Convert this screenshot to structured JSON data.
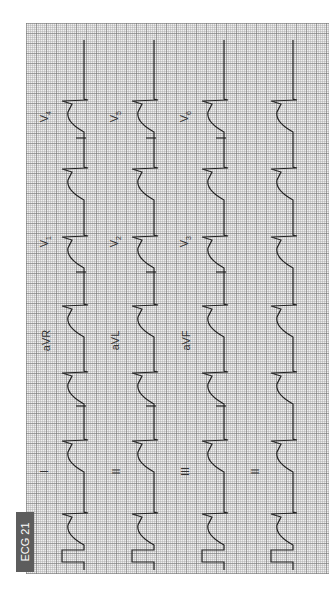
{
  "figure": {
    "tag": "ECG 21",
    "tag_bg_color": "#5d5d5d",
    "orientation": "rotated 90deg counter-clockwise",
    "grid": {
      "small_box_px": 2,
      "large_box_px": 10,
      "bg_color": "#efefef"
    }
  },
  "leads": {
    "col1": [
      {
        "name": "I",
        "label": "I"
      },
      {
        "name": "aVR",
        "label": "aVR"
      },
      {
        "name": "V1",
        "label": "V",
        "sub": "1"
      },
      {
        "name": "V4",
        "label": "V",
        "sub": "4"
      }
    ],
    "col2": [
      {
        "name": "II",
        "label": "II"
      },
      {
        "name": "aVL",
        "label": "aVL"
      },
      {
        "name": "V2",
        "label": "V",
        "sub": "2"
      },
      {
        "name": "V5",
        "label": "V",
        "sub": "5"
      }
    ],
    "col3": [
      {
        "name": "III",
        "label": "III"
      },
      {
        "name": "aVF",
        "label": "aVF"
      },
      {
        "name": "V3",
        "label": "V",
        "sub": "3"
      },
      {
        "name": "V6",
        "label": "V",
        "sub": "6"
      }
    ],
    "col4": [
      {
        "name": "II",
        "label": "II"
      }
    ]
  },
  "rhythm": {
    "beat_positions_y": [
      513,
      440,
      372,
      305,
      236,
      168,
      100
    ],
    "column_baselines_x": [
      84,
      154,
      224,
      293
    ],
    "calibration_pulse": true
  }
}
